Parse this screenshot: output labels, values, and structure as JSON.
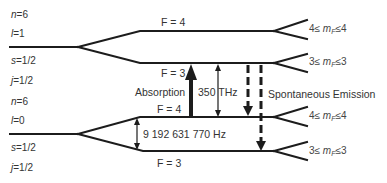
{
  "diagram": {
    "upper_state": {
      "n_label": "n = 6",
      "n_var": "n",
      "n_val": "6",
      "l_var": "l",
      "l_val": "1",
      "s_var": "s",
      "s_val": "1/2",
      "j_var": "j",
      "j_val": "1/2",
      "levels": [
        {
          "F": "F = 4",
          "mF_lo": "4",
          "mF_hi": "4"
        },
        {
          "F": "F = 3",
          "mF_lo": "3",
          "mF_hi": "3"
        }
      ]
    },
    "lower_state": {
      "n_var": "n",
      "n_val": "6",
      "l_var": "l",
      "l_val": "0",
      "s_var": "s",
      "s_val": "1/2",
      "j_var": "j",
      "j_val": "1/2",
      "levels": [
        {
          "F": "F = 4",
          "mF_lo": "4",
          "mF_hi": "4"
        },
        {
          "F": "F = 3",
          "mF_lo": "3",
          "mF_hi": "3"
        }
      ]
    },
    "transitions": {
      "absorption_label": "Absorption",
      "optical_freq_label": "350 THz",
      "spontaneous_label": "Spontaneous Emission",
      "hyperfine_freq_label": "9 192 631 770 Hz"
    },
    "mF_symbol": "m",
    "mF_sub": "F",
    "leq": "≤",
    "eq": "=",
    "colors": {
      "line": "#1c1c1c",
      "text": "#333333",
      "background": "#ffffff"
    }
  }
}
